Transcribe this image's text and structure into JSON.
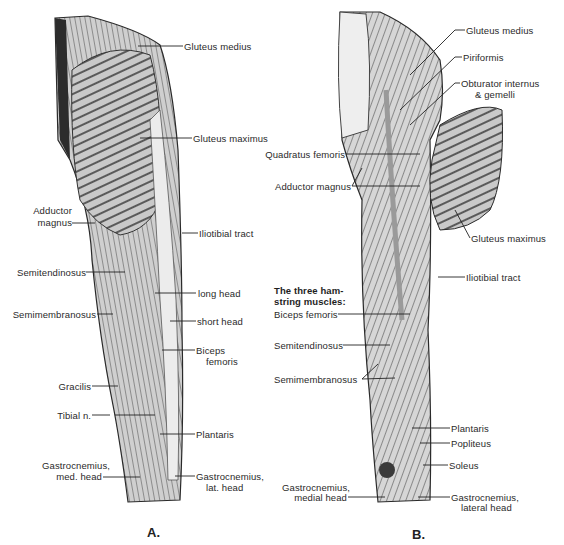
{
  "figure": {
    "panels": [
      {
        "id": "A",
        "caption": "A.",
        "labels": {
          "gluteus_medius": "Gluteus medius",
          "gluteus_maximus": "Gluteus maximus",
          "adductor_magnus_1": "Adductor",
          "adductor_magnus_2": "magnus",
          "iliotibial_tract": "Iliotibial tract",
          "semitendinosus": "Semitendinosus",
          "long_head": "long head",
          "semimembranosus": "Semimembranosus",
          "short_head": "short head",
          "biceps_femoris_1": "Biceps",
          "biceps_femoris_2": "femoris",
          "gracilis": "Gracilis",
          "tibial_n": "Tibial n.",
          "plantaris": "Plantaris",
          "gastroc_med_1": "Gastrocnemius,",
          "gastroc_med_2": "med. head",
          "gastroc_lat_1": "Gastrocnemius,",
          "gastroc_lat_2": "lat. head"
        }
      },
      {
        "id": "B",
        "caption": "B.",
        "heading_1": "The three ham-",
        "heading_2": "string muscles:",
        "labels": {
          "gluteus_medius": "Gluteus medius",
          "piriformis": "Piriformis",
          "obturator_1": "Obturator internus",
          "obturator_2": "& gemelli",
          "quadratus_femoris": "Quadratus femoris",
          "adductor_magnus": "Adductor magnus",
          "gluteus_maximus": "Gluteus maximus",
          "iliotibial_tract": "Iliotibial tract",
          "biceps_femoris": "Biceps femoris",
          "semitendinosus": "Semitendinosus",
          "semimembranosus": "Semimembranosus",
          "plantaris": "Plantaris",
          "popliteus": "Popliteus",
          "soleus": "Soleus",
          "gastroc_med_1": "Gastrocnemius,",
          "gastroc_med_2": "medial head",
          "gastroc_lat_1": "Gastrocnemius,",
          "gastroc_lat_2": "lateral head"
        }
      }
    ]
  }
}
